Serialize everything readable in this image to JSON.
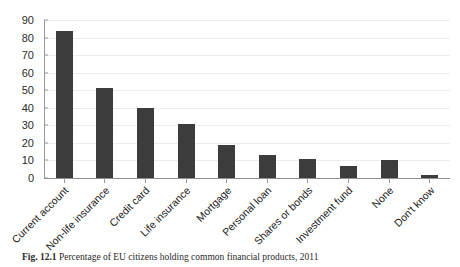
{
  "caption": {
    "label": "Fig. 12.1",
    "text": "Percentage of EU citizens holding common financial products, 2011"
  },
  "colors": {
    "bar": "#3c3c3c",
    "gridline": "#ececec",
    "axis": "#9a9a9a",
    "text": "#1c1c1c",
    "background": "#ffffff"
  },
  "chart_data": {
    "type": "bar",
    "title": "",
    "xlabel": "",
    "ylabel": "",
    "ylim": [
      0,
      90
    ],
    "yticks": [
      0,
      10,
      20,
      30,
      40,
      50,
      60,
      70,
      80,
      90
    ],
    "ytick_labels": [
      "0",
      "10",
      "20",
      "30",
      "40",
      "50",
      "60",
      "70",
      "80",
      "90"
    ],
    "grid": true,
    "legend": false,
    "legend_position": "none",
    "xtick_rotation": -45,
    "categories": [
      "Current account",
      "Non-life insurance",
      "Credit card",
      "Life insurance",
      "Mortgage",
      "Personal loan",
      "Shares or bonds",
      "Investment fund",
      "None",
      "Don't know"
    ],
    "values": [
      84,
      51,
      40,
      31,
      19,
      13,
      11,
      7,
      10,
      2
    ]
  }
}
